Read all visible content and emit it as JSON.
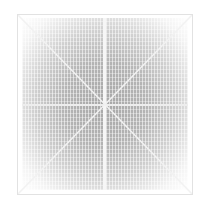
{
  "image": {
    "description": "Abstract grayscale interference texture inside a square frame with diagonal, vertical and horizontal light lines",
    "colors": {
      "background": "#ffffff",
      "texture_dark": "#a8a8a8",
      "texture_light": "#f4f4f4",
      "frame": "#e2e2e2",
      "lines": "#f6f6f6"
    }
  }
}
